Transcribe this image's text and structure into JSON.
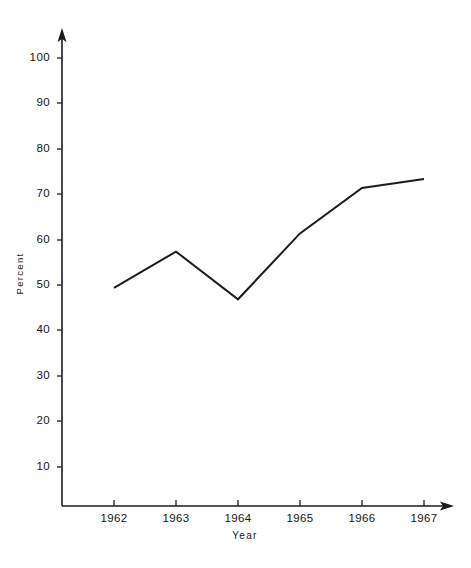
{
  "chart_data": {
    "type": "line",
    "title": "",
    "title_note": "cut-off-at-top-edge",
    "xlabel": "Year",
    "ylabel": "Percent",
    "categories": [
      "1962",
      "1963",
      "1964",
      "1965",
      "1966",
      "1967"
    ],
    "x": [
      1962,
      1963,
      1964,
      1965,
      1966,
      1967
    ],
    "values": [
      48,
      56,
      45.5,
      60,
      70,
      72
    ],
    "series": [
      {
        "name": "Percent",
        "values": [
          48,
          56,
          45.5,
          60,
          70,
          72
        ]
      }
    ],
    "ylim": [
      0,
      105
    ],
    "xlim": [
      1961.5,
      1967.6
    ],
    "yticks": [
      10,
      20,
      30,
      40,
      50,
      60,
      70,
      80,
      90,
      100
    ],
    "ytick_labels": [
      "10",
      "20",
      "30",
      "40",
      "50",
      "60",
      "70",
      "80",
      "90",
      "100"
    ],
    "xticks": [
      1962,
      1963,
      1964,
      1965,
      1966,
      1967
    ],
    "xtick_labels": [
      "1962",
      "1963",
      "1964",
      "1965",
      "1966",
      "1967"
    ],
    "grid": false,
    "legend": false,
    "legend_position": "none",
    "line_color": "#1c1c1c",
    "background_color": "#ffffff",
    "axis_color": "#1c1c1c",
    "axis_arrows": [
      "y-up",
      "x-right"
    ],
    "annotations": []
  },
  "geometry": {
    "plot_origin_x": 62,
    "plot_baseline_y": 506,
    "y_axis_top_y": 30,
    "x_axis_right_x": 452,
    "px_per_unit_y": 4.543,
    "tick_x": [
      114,
      176,
      238,
      300,
      362,
      424
    ],
    "tick_y": [
      467,
      421,
      376,
      330,
      285,
      240,
      194,
      149,
      103,
      58
    ],
    "points_px": [
      {
        "x": 114,
        "y": 288
      },
      {
        "x": 176,
        "y": 252
      },
      {
        "x": 238,
        "y": 300
      },
      {
        "x": 300,
        "y": 234
      },
      {
        "x": 362,
        "y": 188
      },
      {
        "x": 424,
        "y": 179
      }
    ]
  }
}
